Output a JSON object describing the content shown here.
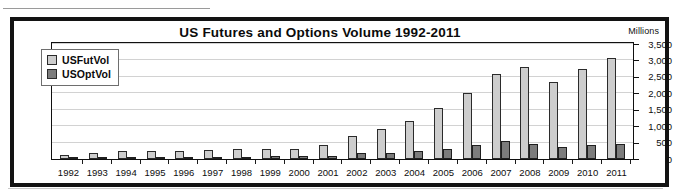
{
  "page": {
    "clipped_header_text": "Futures Volume"
  },
  "chart": {
    "title": "US Futures and Options Volume 1992-2011",
    "units_label": "Millions",
    "legend": [
      {
        "label": "USFutVol",
        "swatch": "light-gray",
        "color": "#cdcdcd"
      },
      {
        "label": "USOptVol",
        "swatch": "dark-gray",
        "color": "#7c7c7c"
      }
    ]
  },
  "chart_data": {
    "type": "bar",
    "title": "US Futures and Options Volume 1992-2011",
    "xlabel": "",
    "ylabel": "Millions",
    "ylim": [
      0,
      3500
    ],
    "ytick_labels": [
      "3,500",
      "3,000",
      "2,500",
      "2,000",
      "1,500",
      "1,000",
      "500",
      "0"
    ],
    "yticks": [
      3500,
      3000,
      2500,
      2000,
      1500,
      1000,
      500,
      0
    ],
    "grid": true,
    "legend_position": "upper-left-inside",
    "categories": [
      "1992",
      "1993",
      "1994",
      "1995",
      "1996",
      "1997",
      "1998",
      "1999",
      "2000",
      "2001",
      "2002",
      "2003",
      "2004",
      "2005",
      "2006",
      "2007",
      "2008",
      "2009",
      "2010",
      "2011"
    ],
    "series": [
      {
        "name": "USFutVol",
        "color": "#cdcdcd",
        "values": [
          130,
          175,
          250,
          245,
          255,
          270,
          310,
          300,
          320,
          425,
          700,
          900,
          1150,
          1550,
          2000,
          2575,
          2800,
          2350,
          2750,
          3075
        ]
      },
      {
        "name": "USOptVol",
        "color": "#7c7c7c",
        "values": [
          25,
          50,
          60,
          55,
          60,
          70,
          75,
          85,
          80,
          105,
          175,
          180,
          240,
          300,
          425,
          555,
          450,
          355,
          440,
          470
        ]
      }
    ]
  }
}
